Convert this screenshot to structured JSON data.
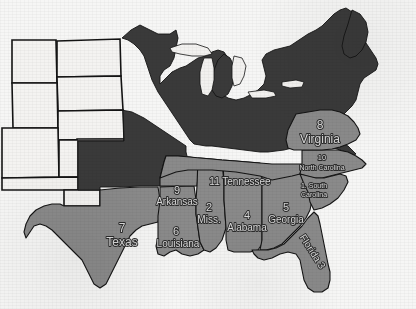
{
  "document": {
    "kind": "scanned-map",
    "title": "Map of the eastern United States with numbered southern states",
    "region": "United States",
    "orientation": "landscape"
  },
  "colors": {
    "paper": "#f6f6f5",
    "unshaded_state_fill": "#f4f3f1",
    "dark_state_fill": "#3a3a3a",
    "highlight_state_fill": "#8a8a8a",
    "border_line": "#141414",
    "label_text": "#d9d9d9",
    "label_outline": "#2b2b2b"
  },
  "legend": {
    "highlighted_count": 11,
    "note_visible": false
  },
  "labels": [
    {
      "id": "texas",
      "number": "7",
      "name": "Texas",
      "x": 122,
      "y": 237,
      "size": "large",
      "rotation": 0,
      "stacked": true
    },
    {
      "id": "louisiana",
      "number": "6",
      "name": "Louisiana",
      "x": 175,
      "y": 238,
      "size": "medium",
      "rotation": 0,
      "stacked": true
    },
    {
      "id": "arkansas",
      "number": "9",
      "name": "Arkansas",
      "x": 176,
      "y": 196,
      "size": "medium",
      "rotation": 0,
      "stacked": true
    },
    {
      "id": "mississippi",
      "number": "2",
      "name": "Miss.",
      "x": 209,
      "y": 213,
      "size": "medium",
      "rotation": 0,
      "stacked": true
    },
    {
      "id": "alabama",
      "number": "4",
      "name": "Alabama",
      "x": 245,
      "y": 221,
      "size": "medium",
      "rotation": 0,
      "stacked": true
    },
    {
      "id": "tennessee",
      "number": "11",
      "name": "Tennessee",
      "x": 239,
      "y": 182,
      "size": "medium",
      "rotation": 0,
      "stacked": false
    },
    {
      "id": "georgia",
      "number": "5",
      "name": "Georgia",
      "x": 285,
      "y": 213,
      "size": "medium",
      "rotation": 0,
      "stacked": true
    },
    {
      "id": "florida",
      "number": "3",
      "name": "Florida",
      "x": 314,
      "y": 254,
      "size": "medium",
      "rotation": 57,
      "stacked": false
    },
    {
      "id": "south-carolina",
      "number": "1.",
      "name": "South Carolina",
      "x": 311,
      "y": 188,
      "size": "small",
      "rotation": 0,
      "stacked": false
    },
    {
      "id": "north-carolina",
      "number": "10",
      "name": "North Carolina",
      "x": 320,
      "y": 163,
      "size": "small",
      "rotation": 0,
      "stacked": true
    },
    {
      "id": "virginia",
      "number": "8",
      "name": "Virginia",
      "x": 320,
      "y": 133,
      "size": "large",
      "rotation": 0,
      "stacked": true
    }
  ],
  "label_text": {
    "texas_number": "7",
    "texas_name": "Texas",
    "louisiana_number": "6",
    "louisiana_name": "Louisiana",
    "arkansas_number": "9",
    "arkansas_name": "Arkansas",
    "mississippi_number": "2",
    "mississippi_name": "Miss.",
    "alabama_number": "4",
    "alabama_name": "Alabama",
    "tennessee_full": "11 Tennessee",
    "georgia_number": "5",
    "georgia_name": "Georgia",
    "florida_full": "Florida 3",
    "south_carolina_line1": "1. South",
    "south_carolina_line2": "Carolina",
    "north_carolina_number": "10",
    "north_carolina_name": "North Carolina",
    "virginia_number": "8",
    "virginia_name": "Virginia"
  }
}
